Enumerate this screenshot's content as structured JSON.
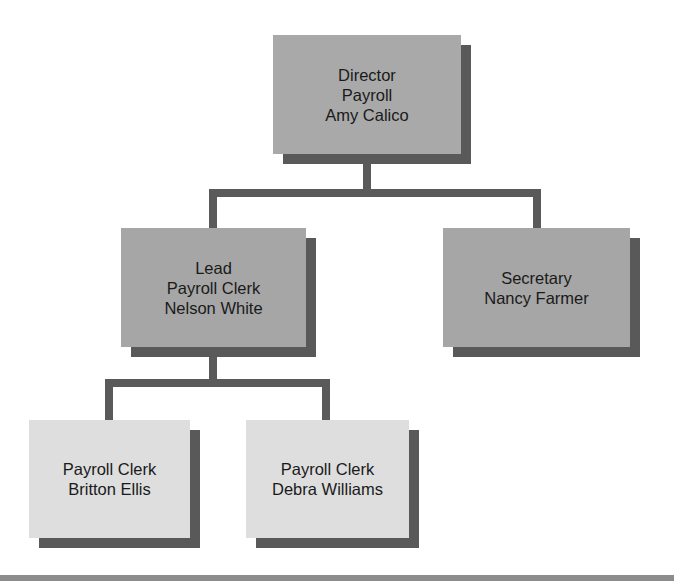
{
  "diagram": {
    "type": "org-chart",
    "colors": {
      "top_level_box": "#a9a9a9",
      "mid_level_box": "#a6a6a6",
      "bottom_level_box": "#dedede",
      "shadow": "#595959",
      "connector": "#5a5a5a",
      "bottom_rule": "#8c8c8c"
    },
    "nodes": {
      "director": {
        "lines": [
          "Director",
          "Payroll",
          "Amy Calico"
        ]
      },
      "lead": {
        "lines": [
          "Lead",
          "Payroll Clerk",
          "Nelson White"
        ]
      },
      "secretary": {
        "lines": [
          "Secretary",
          "Nancy Farmer"
        ]
      },
      "clerk_ellis": {
        "lines": [
          "Payroll Clerk",
          "Britton Ellis"
        ]
      },
      "clerk_williams": {
        "lines": [
          "Payroll Clerk",
          "Debra Williams"
        ]
      }
    },
    "edges": [
      {
        "from": "director",
        "to": "lead"
      },
      {
        "from": "director",
        "to": "secretary"
      },
      {
        "from": "lead",
        "to": "clerk_ellis"
      },
      {
        "from": "lead",
        "to": "clerk_williams"
      }
    ]
  }
}
